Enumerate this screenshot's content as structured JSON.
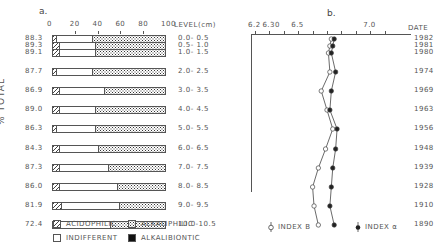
{
  "panel_a": {
    "letter": "a.",
    "x_ticks": [
      "0",
      "20",
      "40",
      "60",
      "80",
      "100"
    ],
    "level_header": "LEVEL(cm)",
    "ylabel": "% TOTAL"
  },
  "panel_b": {
    "letter": "b.",
    "x_ticks": [
      "6.2",
      "6.30",
      "6.5",
      "7.0"
    ],
    "date_header": "DATE"
  },
  "legend": {
    "acidophilic": "ACIDOPHILIC",
    "alkaliphilic": "ALKALIPHILIC",
    "indifferent": "INDIFFERENT",
    "alkalibiontic": "ALKALIBIONTIC",
    "index_b": "INDEX B",
    "index_a": "INDEX α"
  },
  "rows": [
    {
      "total": "88.3",
      "level": "0.0- 0.5",
      "date": "1982"
    },
    {
      "total": "89.3",
      "level": "0.5- 1.0",
      "date": "1981"
    },
    {
      "total": "89.1",
      "level": "1.0- 1.5",
      "date": "1980"
    },
    {
      "total": "87.7",
      "level": "2.0- 2.5",
      "date": "1974"
    },
    {
      "total": "86.9",
      "level": "3.0- 3.5",
      "date": "1969"
    },
    {
      "total": "89.0",
      "level": "4.0- 4.5",
      "date": "1963"
    },
    {
      "total": "86.3",
      "level": "5.0- 5.5",
      "date": "1956"
    },
    {
      "total": "84.3",
      "level": "6.0- 6.5",
      "date": "1948"
    },
    {
      "total": "87.3",
      "level": "7.0- 7.5",
      "date": "1939"
    },
    {
      "total": "86.0",
      "level": "8.0- 8.5",
      "date": "1928"
    },
    {
      "total": "81.9",
      "level": "9.0- 9.5",
      "date": "1910"
    },
    {
      "total": "72.4",
      "level": "10.0-10.5",
      "date": "1890"
    }
  ],
  "chart_data": [
    {
      "type": "bar",
      "title": "a. Diatom pH-preference groups (% of total)",
      "stacked": true,
      "orientation": "horizontal",
      "xlabel": "%",
      "ylabel": "% TOTAL",
      "xlim": [
        0,
        100
      ],
      "categories": [
        "0.0-0.5",
        "0.5-1.0",
        "1.0-1.5",
        "2.0-2.5",
        "3.0-3.5",
        "4.0-4.5",
        "5.0-5.5",
        "6.0-6.5",
        "7.0-7.5",
        "8.0-8.5",
        "9.0-9.5",
        "10.0-10.5"
      ],
      "pct_total": [
        88.3,
        89.3,
        89.1,
        87.7,
        86.9,
        89.0,
        86.3,
        84.3,
        87.3,
        86.0,
        81.9,
        72.4
      ],
      "series": [
        {
          "name": "ACIDOPHILIC",
          "values": [
            4,
            6,
            6,
            4,
            6,
            6,
            4,
            6,
            6,
            6,
            8,
            5
          ]
        },
        {
          "name": "INDIFFERENT",
          "values": [
            32,
            32,
            32,
            32,
            40,
            32,
            34,
            35,
            44,
            52,
            52,
            47
          ]
        },
        {
          "name": "ALKALIPHILIC",
          "values": [
            64,
            62,
            62,
            64,
            54,
            62,
            62,
            59,
            50,
            42,
            40,
            48
          ]
        },
        {
          "name": "ALKALIBIONTIC",
          "values": [
            0,
            0,
            0,
            0,
            0,
            0,
            0,
            0,
            0,
            0,
            0,
            0
          ]
        }
      ]
    },
    {
      "type": "line",
      "title": "b. Inferred pH",
      "xlabel": "pH",
      "xlim": [
        6.2,
        7.1
      ],
      "x_tick_labels": [
        "6.2",
        "6.30",
        "6.5",
        "7.0"
      ],
      "categories": [
        "1982",
        "1981",
        "1980",
        "1974",
        "1969",
        "1963",
        "1956",
        "1948",
        "1939",
        "1928",
        "1910",
        "1890"
      ],
      "series": [
        {
          "name": "INDEX B",
          "marker": "open",
          "values": [
            6.73,
            6.72,
            6.71,
            6.72,
            6.66,
            6.7,
            6.74,
            6.69,
            6.64,
            6.6,
            6.61,
            6.64
          ]
        },
        {
          "name": "INDEX α",
          "marker": "filled",
          "values": [
            6.75,
            6.74,
            6.73,
            6.76,
            6.73,
            6.72,
            6.77,
            6.76,
            6.74,
            6.73,
            6.72,
            6.75
          ]
        }
      ]
    }
  ]
}
